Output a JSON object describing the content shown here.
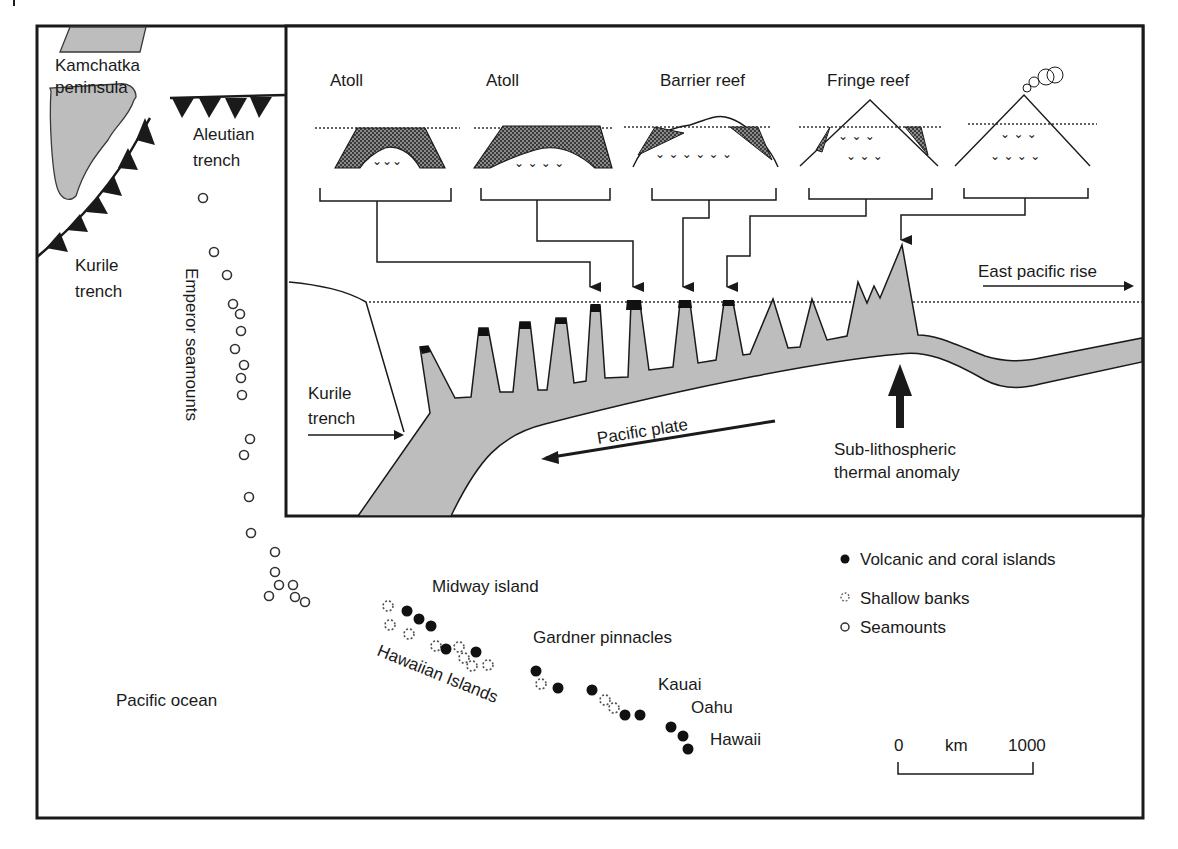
{
  "map": {
    "labels": {
      "kamchatka_1": "Kamchatka",
      "kamchatka_2": "peninsula",
      "aleutian_1": "Aleutian",
      "aleutian_2": "trench",
      "kurile_1": "Kurile",
      "kurile_2": "trench",
      "emperor": "Emperor seamounts",
      "midway": "Midway island",
      "hawaiian_islands": "Hawaiian Islands",
      "gardner": "Gardner pinnacles",
      "kauai": "Kauai",
      "oahu": "Oahu",
      "hawaii": "Hawaii",
      "pacific_ocean": "Pacific ocean"
    },
    "legend": {
      "volcanic": "Volcanic and coral islands",
      "shallow": "Shallow banks",
      "seamounts": "Seamounts"
    },
    "scale_bar": {
      "start": "0",
      "unit": "km",
      "end": "1000"
    }
  },
  "inset": {
    "stages": [
      {
        "label": "Atoll"
      },
      {
        "label": "Atoll"
      },
      {
        "label": "Barrier reef"
      },
      {
        "label": "Fringe reef"
      },
      {
        "label": ""
      }
    ],
    "labels": {
      "east_pacific_rise": "East pacific rise",
      "kurile_1": "Kurile",
      "kurile_2": "trench",
      "pacific_plate": "Pacific plate",
      "anomaly_1": "Sub-lithospheric",
      "anomaly_2": "thermal anomaly"
    }
  },
  "colors": {
    "ink": "#1a1a1a",
    "gray_fill": "#bdbdbd",
    "reef_fill": "#6e6e6e",
    "background": "#ffffff"
  }
}
